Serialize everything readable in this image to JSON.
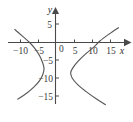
{
  "figure": {
    "type": "cartesian-plot",
    "background_color": "#ffffff",
    "axis_color": "#4a4a4a",
    "curve_color": "#585858"
  },
  "axes": {
    "x_axis_label": "x",
    "y_axis_label": "y",
    "origin_label": "0",
    "x_ticks": [
      {
        "value": -10,
        "label": "−10",
        "px": 20.5
      },
      {
        "value": -5,
        "label": "−5",
        "px": 38.5
      },
      {
        "value": 5,
        "label": "5",
        "px": 74.5
      },
      {
        "value": 10,
        "label": "10",
        "px": 92.5
      },
      {
        "value": 15,
        "label": "15",
        "px": 110.5
      }
    ],
    "y_ticks": [
      {
        "value": 5,
        "label": "5",
        "px": 24.0
      },
      {
        "value": -5,
        "label": "−5",
        "px": 60.0
      },
      {
        "value": -10,
        "label": "−10",
        "px": 78.0
      },
      {
        "value": -15,
        "label": "−15",
        "px": 96.0
      }
    ],
    "x_range": [
      -12,
      17
    ],
    "y_range": [
      -17,
      7
    ],
    "grid": false
  },
  "chart_data": {
    "type": "line",
    "title": "",
    "xlabel": "x",
    "ylabel": "y",
    "xlim": [
      -12,
      17
    ],
    "ylim": [
      -17,
      7
    ],
    "grid": false,
    "x_ticks": [
      -10,
      -5,
      5,
      10,
      15
    ],
    "y_ticks": [
      5,
      -5,
      -10,
      -15
    ],
    "legend": null,
    "series": [
      {
        "name": "left-branch",
        "comment": "hyperbola branch opening to the left, vertex near (-3, -7)",
        "points": [
          [
            -11.0,
            3.5
          ],
          [
            -9.0,
            1.8
          ],
          [
            -7.0,
            0.0
          ],
          [
            -5.5,
            -1.7
          ],
          [
            -4.3,
            -3.6
          ],
          [
            -3.5,
            -5.4
          ],
          [
            -3.1,
            -7.0
          ],
          [
            -3.4,
            -8.6
          ],
          [
            -4.3,
            -10.3
          ],
          [
            -5.8,
            -12.0
          ],
          [
            -7.8,
            -13.7
          ],
          [
            -10.2,
            -15.3
          ]
        ]
      },
      {
        "name": "right-branch",
        "comment": "hyperbola branch opening to the right, vertex near (3.5, -8)",
        "points": [
          [
            17.0,
            4.0
          ],
          [
            14.5,
            2.3
          ],
          [
            12.0,
            0.4
          ],
          [
            10.2,
            -1.4
          ],
          [
            8.0,
            -3.2
          ],
          [
            6.0,
            -5.2
          ],
          [
            4.6,
            -7.0
          ],
          [
            4.1,
            -8.2
          ],
          [
            4.5,
            -9.6
          ],
          [
            6.0,
            -11.4
          ],
          [
            8.2,
            -13.2
          ],
          [
            11.0,
            -15.2
          ],
          [
            13.5,
            -16.8
          ]
        ]
      }
    ]
  }
}
